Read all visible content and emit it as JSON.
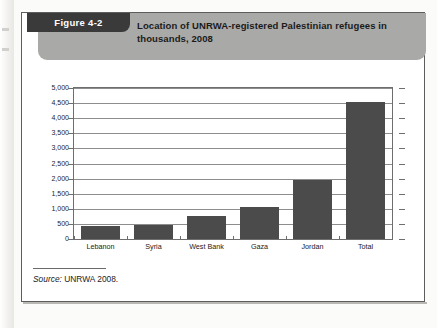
{
  "figure": {
    "badge_label": "Figure 4-2",
    "title": "Location of UNRWA-registered Palestinian refugees in thousands, 2008",
    "source_prefix": "Source:",
    "source_text": "UNRWA 2008."
  },
  "colors": {
    "bar": "#4b4b4b",
    "badge": "#3a3a3a",
    "banner": "#a9a9a7",
    "gridline": "#8d8d8d",
    "frame": "#5d5d5d"
  },
  "chart_data": {
    "type": "bar",
    "title": "Location of UNRWA-registered Palestinian refugees in thousands, 2008",
    "xlabel": "",
    "ylabel": "",
    "categories": [
      "Lebanon",
      "Syria",
      "West Bank",
      "Gaza",
      "Jordan",
      "Total"
    ],
    "values": [
      420,
      450,
      750,
      1050,
      1950,
      4550
    ],
    "ylim": [
      0,
      5000
    ],
    "ytick_values": [
      0,
      500,
      1000,
      1500,
      2000,
      2500,
      3000,
      3500,
      4000,
      4500,
      5000
    ],
    "ytick_labels": [
      "0",
      "500",
      "1,000",
      "1,500",
      "2,000",
      "2,500",
      "3,000",
      "3,500",
      "4,000",
      "4,500",
      "5,000"
    ],
    "grid": true,
    "legend": false,
    "units": "thousands of refugees",
    "year": 2008
  }
}
